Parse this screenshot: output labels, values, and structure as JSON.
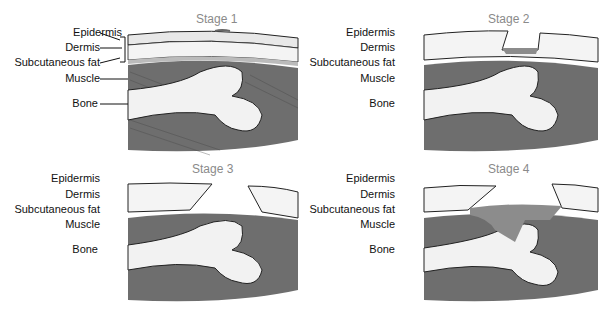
{
  "figure": {
    "panels": [
      {
        "title": "Stage 1",
        "labels": {
          "epidermis": "Epidermis",
          "dermis": "Dermis",
          "fat": "Subcutaneous fat",
          "muscle": "Muscle",
          "bone": "Bone"
        }
      },
      {
        "title": "Stage 2",
        "labels": {
          "epidermis": "Epidermis",
          "dermis": "Dermis",
          "fat": "Subcutaneous fat",
          "muscle": "Muscle",
          "bone": "Bone"
        }
      },
      {
        "title": "Stage 3",
        "labels": {
          "epidermis": "Epidermis",
          "dermis": "Dermis",
          "fat": "Subcutaneous fat",
          "muscle": "Muscle",
          "bone": "Bone"
        }
      },
      {
        "title": "Stage 4",
        "labels": {
          "epidermis": "Epidermis",
          "dermis": "Dermis",
          "fat": "Subcutaneous fat",
          "muscle": "Muscle",
          "bone": "Bone"
        }
      }
    ],
    "colors": {
      "skin": "#e8e8e8",
      "fat": "#f4f4f4",
      "muscle": "#6e6e6e",
      "bone": "#f2f2f2",
      "wound": "#8c8c8c",
      "title": "#8a8a8a"
    }
  }
}
